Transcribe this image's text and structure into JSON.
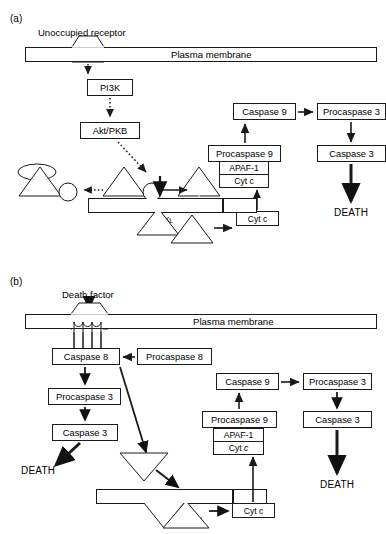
{
  "figure": {
    "header": "",
    "panels": [
      {
        "id": "a",
        "letter": "(a)",
        "membrane_label": "Plasma membrane",
        "mito_label": "Mitochondrial membrane",
        "receptor_label": "Unoccupied receptor",
        "nodes": {
          "pi3k": "PI3K",
          "akt": "Akt/PKB",
          "s1433": "14-2-3",
          "bad1": "Bad",
          "p1": "P",
          "bad2": "Bad",
          "p2": "P",
          "bad3": "Bad",
          "bclxl": "Bcl-X",
          "bclxl_sub": "L",
          "bad4": "Bad",
          "cytc_mito": "Cyt c",
          "cytc_top": "Cyt c",
          "apaf1": "APAF-1",
          "procaspase9": "Procaspase 9",
          "caspase9": "Caspase 9",
          "procaspase3": "Procaspase 3",
          "caspase3": "Caspase 3",
          "death": "DEATH"
        }
      },
      {
        "id": "b",
        "letter": "(b)",
        "membrane_label": "Plasma membrane",
        "mito_label": "Mitochondrial membrane",
        "receptor_label": "Death factor",
        "nodes": {
          "caspase8": "Caspase 8",
          "procaspase8": "Procaspase 8",
          "procaspase3_left": "Procaspase 3",
          "caspase3_left": "Caspase 3",
          "death_left": "DEATH",
          "bid_free": "Bid",
          "bid_mito": "Bid",
          "bax": "Bax",
          "cytc_mito": "Cyt c",
          "cytc_top": "Cyt c",
          "cytc_top_italic": "c",
          "apaf1": "APAF-1",
          "procaspase9": "Procaspase 9",
          "caspase9": "Caspase 9",
          "procaspase3_right": "Procaspase 3",
          "caspase3_right": "Caspase 3",
          "death_right": "DEATH"
        }
      }
    ],
    "colors": {
      "stroke": "#1a1a1a",
      "background": "#ffffff",
      "text": "#000000"
    }
  }
}
